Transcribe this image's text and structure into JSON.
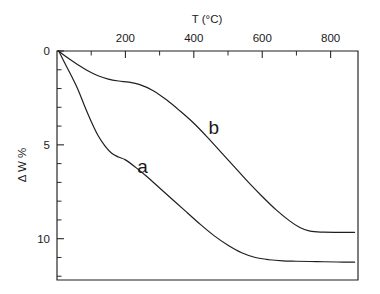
{
  "figure": {
    "background": "#ffffff",
    "ink_color": "#1f1f1f"
  },
  "axes": {
    "x_title": "T (°C)",
    "y_title": "Δ W %",
    "x_tick_labels": [
      "200",
      "400",
      "600",
      "800"
    ],
    "y_tick_labels": [
      "0",
      "5",
      "10"
    ]
  },
  "labels": {
    "curve_a": "a",
    "curve_b": "b"
  },
  "chart_data": {
    "type": "line",
    "title": "",
    "subtitle": "",
    "xlabel": "T (°C)",
    "ylabel": "Δ W %",
    "xlim": [
      0,
      880
    ],
    "ylim": [
      0,
      12.2
    ],
    "y_inverted": true,
    "x_axis_position": "top",
    "y_axis_position": "left",
    "grid": false,
    "legend": "inline-annotations",
    "x_major_ticks": [
      200,
      400,
      600,
      800
    ],
    "x_minor_tick_interval": 100,
    "y_major_ticks": [
      0,
      5,
      10
    ],
    "y_minor_tick_interval": 1,
    "annotations": [
      {
        "text": "a",
        "x": 250,
        "y": 6.5
      },
      {
        "text": "b",
        "x": 458,
        "y": 4.4
      }
    ],
    "series": [
      {
        "name": "a",
        "label": "a",
        "x": [
          5,
          20,
          40,
          60,
          80,
          100,
          120,
          140,
          160,
          180,
          200,
          230,
          260,
          300,
          340,
          380,
          420,
          460,
          500,
          540,
          580,
          620,
          660,
          700,
          760,
          820,
          870
        ],
        "values": [
          0.0,
          0.55,
          1.25,
          2.0,
          2.9,
          3.75,
          4.5,
          5.05,
          5.45,
          5.65,
          5.8,
          6.2,
          6.65,
          7.3,
          7.95,
          8.6,
          9.25,
          9.85,
          10.35,
          10.75,
          11.0,
          11.12,
          11.18,
          11.2,
          11.22,
          11.24,
          11.25
        ]
      },
      {
        "name": "b",
        "label": "b",
        "x": [
          5,
          30,
          60,
          90,
          120,
          150,
          180,
          210,
          240,
          280,
          320,
          360,
          400,
          440,
          480,
          520,
          560,
          600,
          640,
          680,
          710,
          740,
          780,
          820,
          870
        ],
        "values": [
          0.0,
          0.35,
          0.72,
          1.05,
          1.32,
          1.5,
          1.6,
          1.66,
          1.78,
          2.1,
          2.6,
          3.2,
          3.85,
          4.6,
          5.4,
          6.2,
          7.0,
          7.75,
          8.45,
          9.05,
          9.4,
          9.6,
          9.65,
          9.66,
          9.66
        ]
      }
    ]
  }
}
